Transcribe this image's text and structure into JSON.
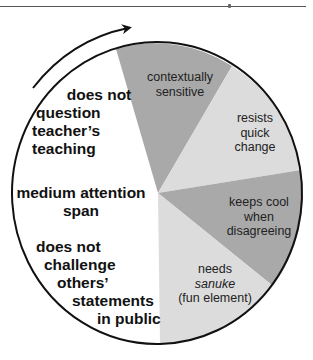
{
  "colors": {
    "dark_slice": "#a9a9a9",
    "light_slice": "#dcdcdc",
    "background_region": "#ffffff",
    "outline": "#111111"
  },
  "left_region": {
    "labels": [
      [
        "does not",
        "question",
        "teacher’s",
        "teaching"
      ],
      [
        "medium attention",
        "span"
      ],
      [
        "does not",
        "challenge",
        "others’",
        "statements",
        "in public"
      ]
    ]
  },
  "slices": [
    {
      "label_lines": [
        "contextually",
        "sensitive"
      ],
      "shade": "dark"
    },
    {
      "label_lines": [
        "resists",
        "quick",
        "change"
      ],
      "shade": "light"
    },
    {
      "label_lines": [
        "keeps cool",
        "when",
        "disagreeing"
      ],
      "shade": "dark"
    },
    {
      "label_lines": [
        "needs",
        "sanuke",
        "(fun element)"
      ],
      "italic_line": 1,
      "shade": "light"
    }
  ],
  "arrow": {
    "direction": "clockwise",
    "icon": "curved-arrow-icon"
  }
}
